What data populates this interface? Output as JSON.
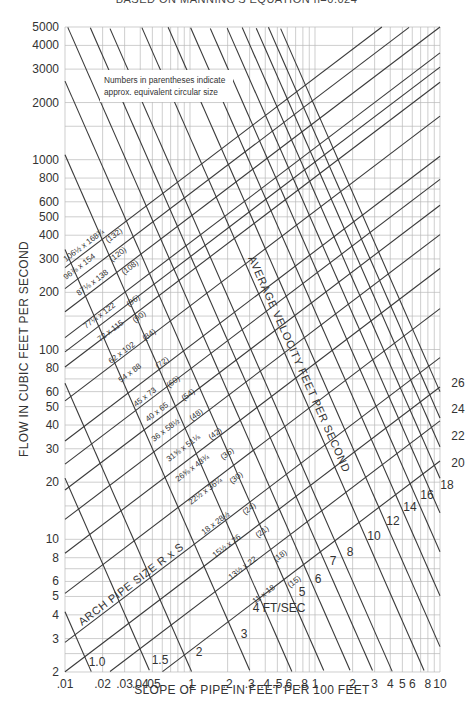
{
  "title": "BASED ON MANNING'S EQUATION n=0.024",
  "note": {
    "line1": "Numbers in parentheses indicate",
    "line2": "approx. equivalent circular size"
  },
  "chart_data": {
    "type": "line",
    "title": "BASED ON MANNING'S EQUATION n=0.024",
    "subtitle": "Numbers in parentheses indicate approx. equivalent circular size",
    "xlabel": "SLOPE OF PIPE IN FEET PER 100 FEET",
    "ylabel": "FLOW IN CUBIC FEET PER SECOND",
    "xscale": "log",
    "yscale": "log",
    "xlim": [
      0.01,
      10
    ],
    "ylim": [
      2,
      5000
    ],
    "grid": true,
    "x_ticks": [
      ".01",
      ".02",
      ".03",
      ".04",
      ".05",
      ".1",
      ".2",
      ".3",
      ".4",
      ".5",
      ".6",
      ".8",
      "1",
      "2",
      "3",
      "4",
      "5",
      "6",
      "8",
      "10"
    ],
    "x_tick_values": [
      0.01,
      0.02,
      0.03,
      0.04,
      0.05,
      0.1,
      0.2,
      0.3,
      0.4,
      0.5,
      0.6,
      0.8,
      1,
      2,
      3,
      4,
      5,
      6,
      8,
      10
    ],
    "y_ticks": [
      "2",
      "3",
      "4",
      "5",
      "6",
      "8",
      "10",
      "20",
      "30",
      "40",
      "50",
      "60",
      "80",
      "100",
      "200",
      "300",
      "400",
      "500",
      "600",
      "800",
      "1000",
      "2000",
      "3000",
      "4000",
      "5000"
    ],
    "y_tick_values": [
      2,
      3,
      4,
      5,
      6,
      8,
      10,
      20,
      30,
      40,
      50,
      60,
      80,
      100,
      200,
      300,
      400,
      500,
      600,
      800,
      1000,
      2000,
      3000,
      4000,
      5000
    ],
    "pipe_size_series_label": "ARCH PIPE SIZE R x S",
    "pipe_sizes": [
      {
        "size": "106½ x 168¾",
        "equiv": "(132)",
        "equiv_in": 132
      },
      {
        "size": "96⅞ x 154",
        "equiv": "(120)",
        "equiv_in": 120
      },
      {
        "size": "87⅛ x 138",
        "equiv": "(108)",
        "equiv_in": 108
      },
      {
        "size": "77¼ x 122",
        "equiv": "(96)",
        "equiv_in": 96
      },
      {
        "size": "72 x 115",
        "equiv": "(90)",
        "equiv_in": 90
      },
      {
        "size": "62 x 102",
        "equiv": "(84)",
        "equiv_in": 84
      },
      {
        "size": "54 x 88",
        "equiv": "(72)",
        "equiv_in": 72
      },
      {
        "size": "45 x 73",
        "equiv": "(60)",
        "equiv_in": 60
      },
      {
        "size": "40 x 65",
        "equiv": "(54)",
        "equiv_in": 54
      },
      {
        "size": "36 x 58½",
        "equiv": "(48)",
        "equiv_in": 48
      },
      {
        "size": "31⅝ x 51⅛",
        "equiv": "(42)",
        "equiv_in": 42
      },
      {
        "size": "26⅝ x 43¾",
        "equiv": "(36)",
        "equiv_in": 36
      },
      {
        "size": "22½ x 36¼",
        "equiv": "(30)",
        "equiv_in": 30
      },
      {
        "size": "18 x 28½",
        "equiv": "(24)",
        "equiv_in": 24
      },
      {
        "size": "15½ x 26",
        "equiv": "(21)",
        "equiv_in": 21
      },
      {
        "size": "13½ x 22",
        "equiv": "(18)",
        "equiv_in": 18
      },
      {
        "size": "11 x 18",
        "equiv": "(15)",
        "equiv_in": 15
      }
    ],
    "velocity_series_label": "AVERAGE VELOCITY FEET PER SECOND",
    "velocity_unit_label": "4 FT/SEC",
    "velocities": [
      "1.0",
      "1.5",
      "2",
      "3",
      "4",
      "5",
      "6",
      "7",
      "8",
      "10",
      "12",
      "14",
      "16",
      "18",
      "20",
      "22",
      "24",
      "26"
    ],
    "reference": {
      "Q_at_S1_for_132in_cfs": 2700,
      "V_at_S1_for_132in_fps": 28.4
    }
  }
}
